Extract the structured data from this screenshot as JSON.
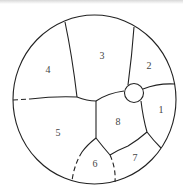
{
  "diagram": {
    "type": "circle partitioned into numbered regions",
    "regions": [
      {
        "id": "1",
        "label": "1",
        "x": 161,
        "y": 113
      },
      {
        "id": "2",
        "label": "2",
        "x": 149,
        "y": 69
      },
      {
        "id": "3",
        "label": "3",
        "x": 102,
        "y": 59
      },
      {
        "id": "4",
        "label": "4",
        "x": 48,
        "y": 73
      },
      {
        "id": "5",
        "label": "5",
        "x": 58,
        "y": 136
      },
      {
        "id": "6",
        "label": "6",
        "x": 95,
        "y": 167
      },
      {
        "id": "7",
        "label": "7",
        "x": 135,
        "y": 161
      },
      {
        "id": "8",
        "label": "8",
        "x": 118,
        "y": 125
      }
    ],
    "features": [
      "small circle at junction of regions 1, 2, 3, 8",
      "dashed boundaries on left of region 4/5 and around region 6"
    ]
  }
}
